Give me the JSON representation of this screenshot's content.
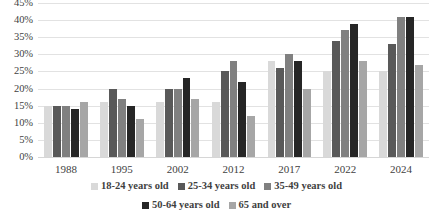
{
  "chart_data": {
    "type": "bar",
    "title": "",
    "subtitle": "",
    "xlabel": "",
    "ylabel": "",
    "categories": [
      "1988",
      "1995",
      "2002",
      "2012",
      "2017",
      "2022",
      "2024"
    ],
    "ylim": [
      0,
      45
    ],
    "ytick_step": 5,
    "ytick_labels": [
      "45%",
      "40%",
      "35%",
      "30%",
      "25%",
      "20%",
      "15%",
      "10%",
      "5%",
      "0%"
    ],
    "ytick_values": [
      45,
      40,
      35,
      30,
      25,
      20,
      15,
      10,
      5,
      0
    ],
    "grid": true,
    "grid_axis": "y",
    "legend_position": "bottom",
    "value_suffix": "%",
    "series": [
      {
        "name": "18-24 years old",
        "color": "#d9d9d9",
        "values": [
          15,
          16,
          16,
          16,
          28,
          25,
          25
        ]
      },
      {
        "name": "25-34 years old",
        "color": "#595959",
        "values": [
          15,
          20,
          20,
          25,
          26,
          34,
          33
        ]
      },
      {
        "name": "35-49 years old",
        "color": "#808080",
        "values": [
          15,
          17,
          20,
          28,
          30,
          37,
          41
        ]
      },
      {
        "name": "50-64 years old",
        "color": "#262626",
        "values": [
          14,
          15,
          23,
          22,
          28,
          39,
          41
        ]
      },
      {
        "name": "65 and over",
        "color": "#a6a6a6",
        "values": [
          16,
          11,
          17,
          12,
          20,
          28,
          27
        ]
      }
    ]
  },
  "colors": {
    "background": "#ffffff",
    "text": "#3f3f3f",
    "gridline": "#e2e2e2",
    "baseline": "#d6d6d6"
  }
}
